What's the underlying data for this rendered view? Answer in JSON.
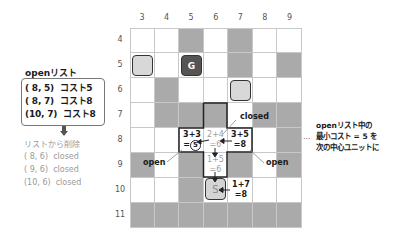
{
  "open_list": {
    "title": "openリスト",
    "rows": [
      {
        "label": "( 8, 5)  コスト5"
      },
      {
        "label": "( 8, 7)  コスト8"
      },
      {
        "label": "(10, 7)  コスト8"
      }
    ]
  },
  "removed_list": {
    "title": "リストから削除",
    "rows": [
      {
        "label": "( 8, 6)  closed"
      },
      {
        "label": "( 9, 6)  closed"
      },
      {
        "label": "(10, 6)  closed"
      }
    ]
  },
  "grid": {
    "columns": [
      "3",
      "4",
      "5",
      "6",
      "7",
      "8",
      "9"
    ],
    "rows": [
      "4",
      "5",
      "6",
      "7",
      "8",
      "9",
      "10",
      "11"
    ],
    "cells": [
      [
        "white",
        "white",
        "gray",
        "white",
        "gray",
        "white",
        "white"
      ],
      [
        "white",
        "white",
        "white",
        "white",
        "gray",
        "white",
        "gray"
      ],
      [
        "white",
        "gray",
        "white",
        "white",
        "white",
        "white",
        "white"
      ],
      [
        "white",
        "gray",
        "gray",
        "gray",
        "white",
        "gray",
        "gray"
      ],
      [
        "white",
        "white",
        "white",
        "white",
        "white",
        "white",
        "gray"
      ],
      [
        "gray",
        "white",
        "gray",
        "white",
        "gray",
        "white",
        "gray"
      ],
      [
        "white",
        "white",
        "gray",
        "white",
        "white",
        "white",
        "white"
      ],
      [
        "gray",
        "gray",
        "gray",
        "gray",
        "gray",
        "gray",
        "gray"
      ]
    ],
    "colors": {
      "gray": "#aaaaaa",
      "white": "#ffffff",
      "goal": "#555555",
      "light": "#d8d8d8"
    },
    "goal_label": "G",
    "start_label": "S",
    "costs": {
      "left": {
        "line1": "3+3",
        "eq": "=",
        "value": "5"
      },
      "center": {
        "line1": "2+4",
        "line2": "=6"
      },
      "right": {
        "line1": "3+5",
        "line2": "=8"
      },
      "below": {
        "line1": "1+5",
        "line2": "=6"
      },
      "start_right": {
        "line1": "1+7",
        "line2": "=8"
      }
    },
    "labels": {
      "closed": "closed",
      "open_left": "open",
      "open_right": "open"
    }
  },
  "note": {
    "dots": "…",
    "lines": [
      "openリスト中の",
      "最小コスト = 5 を",
      "次の中心ユニットに"
    ]
  }
}
